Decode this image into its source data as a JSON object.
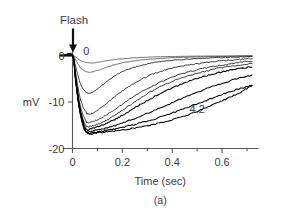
{
  "figure": {
    "panel_label": "(a)",
    "flash_marker_label": "Flash"
  },
  "chart_data": {
    "type": "line",
    "title": "",
    "subtitle": "",
    "xlabel": "Time (sec)",
    "ylabel": "mV",
    "xlim": [
      -0.035,
      0.72
    ],
    "ylim": [
      -20,
      1.5
    ],
    "grid": false,
    "legend_position": "inline-annotations",
    "x_ticks": [
      0,
      0.2,
      0.4,
      0.6
    ],
    "x_tick_labels": [
      "0",
      "0.2",
      "0.4",
      "0.6"
    ],
    "x_minor_ticks": [
      0.1,
      0.3,
      0.5,
      0.7
    ],
    "y_ticks": [
      0,
      -10,
      -20
    ],
    "y_tick_labels": [
      "0",
      "-10",
      "-20"
    ],
    "annotations": [
      {
        "text": "Flash",
        "x": 0.0,
        "y": 1.5,
        "note": "arrow marks flash onset at t = 0"
      },
      {
        "text": "0",
        "x": 0.055,
        "y": 0.2,
        "note": "label for dimmest flash trace"
      },
      {
        "text": "4.2",
        "x": 0.5,
        "y": -12.4,
        "note": "label for brightest flash trace, log intensity 4.2"
      }
    ],
    "series": [
      {
        "name": "0",
        "intensity_log": 0,
        "peak_mv": -1.6,
        "peak_time_sec": 0.075,
        "x": [
          -0.035,
          0,
          0.01,
          0.02,
          0.03,
          0.045,
          0.06,
          0.075,
          0.09,
          0.11,
          0.13,
          0.16,
          0.2,
          0.25,
          0.3,
          0.36,
          0.42,
          0.48,
          0.54,
          0.6,
          0.66,
          0.72
        ],
        "values": [
          0,
          0,
          -0.25,
          -0.6,
          -1.0,
          -1.35,
          -1.55,
          -1.6,
          -1.55,
          -1.4,
          -1.2,
          -0.95,
          -0.7,
          -0.5,
          -0.35,
          -0.25,
          -0.2,
          -0.15,
          -0.12,
          -0.1,
          -0.08,
          -0.05
        ]
      },
      {
        "name": "trace-2",
        "intensity_log": 0.6,
        "peak_mv": -3.6,
        "peak_time_sec": 0.07,
        "x": [
          -0.035,
          0,
          0.01,
          0.02,
          0.03,
          0.045,
          0.06,
          0.07,
          0.085,
          0.1,
          0.12,
          0.15,
          0.19,
          0.24,
          0.3,
          0.36,
          0.42,
          0.48,
          0.54,
          0.6,
          0.66,
          0.72
        ],
        "values": [
          0,
          0,
          -0.7,
          -1.6,
          -2.5,
          -3.2,
          -3.55,
          -3.6,
          -3.45,
          -3.2,
          -2.85,
          -2.3,
          -1.7,
          -1.2,
          -0.85,
          -0.6,
          -0.45,
          -0.35,
          -0.28,
          -0.22,
          -0.16,
          -0.1
        ]
      },
      {
        "name": "trace-3",
        "intensity_log": 1.2,
        "peak_mv": -8.1,
        "peak_time_sec": 0.065,
        "x": [
          -0.035,
          0,
          0.01,
          0.02,
          0.03,
          0.04,
          0.055,
          0.065,
          0.08,
          0.095,
          0.115,
          0.14,
          0.175,
          0.22,
          0.27,
          0.33,
          0.39,
          0.46,
          0.53,
          0.6,
          0.66,
          0.72
        ],
        "values": [
          0,
          0,
          -1.8,
          -3.9,
          -5.8,
          -7.0,
          -7.9,
          -8.1,
          -7.9,
          -7.4,
          -6.6,
          -5.5,
          -4.2,
          -3.0,
          -2.2,
          -1.5,
          -1.1,
          -0.8,
          -0.6,
          -0.45,
          -0.32,
          -0.2
        ]
      },
      {
        "name": "trace-4",
        "intensity_log": 1.8,
        "peak_mv": -12.6,
        "peak_time_sec": 0.062,
        "x": [
          -0.035,
          0,
          0.01,
          0.02,
          0.03,
          0.042,
          0.055,
          0.062,
          0.08,
          0.1,
          0.125,
          0.155,
          0.195,
          0.24,
          0.3,
          0.36,
          0.43,
          0.5,
          0.57,
          0.63,
          0.68,
          0.72
        ],
        "values": [
          0,
          0,
          -2.8,
          -6.2,
          -9.0,
          -11.0,
          -12.3,
          -12.6,
          -12.4,
          -11.8,
          -10.8,
          -9.5,
          -7.8,
          -6.2,
          -4.5,
          -3.3,
          -2.4,
          -1.8,
          -1.3,
          -1.0,
          -0.8,
          -0.6
        ]
      },
      {
        "name": "trace-5",
        "intensity_log": 2.2,
        "peak_mv": -14.4,
        "peak_time_sec": 0.06,
        "x": [
          -0.035,
          0,
          0.01,
          0.02,
          0.03,
          0.042,
          0.055,
          0.06,
          0.085,
          0.11,
          0.14,
          0.18,
          0.23,
          0.29,
          0.35,
          0.42,
          0.49,
          0.56,
          0.62,
          0.67,
          0.72
        ],
        "values": [
          0,
          0,
          -3.4,
          -7.4,
          -10.6,
          -12.8,
          -14.2,
          -14.4,
          -14.2,
          -13.6,
          -12.7,
          -11.2,
          -9.4,
          -7.4,
          -5.8,
          -4.3,
          -3.2,
          -2.4,
          -1.9,
          -1.5,
          -1.2
        ]
      },
      {
        "name": "trace-6",
        "intensity_log": 2.6,
        "peak_mv": -15.3,
        "peak_time_sec": 0.058,
        "x": [
          -0.035,
          0,
          0.01,
          0.02,
          0.032,
          0.045,
          0.058,
          0.075,
          0.1,
          0.13,
          0.165,
          0.21,
          0.26,
          0.32,
          0.39,
          0.46,
          0.53,
          0.6,
          0.66,
          0.72
        ],
        "values": [
          0,
          0,
          -3.9,
          -8.4,
          -12.0,
          -14.1,
          -15.3,
          -15.2,
          -14.8,
          -14.1,
          -13.0,
          -11.4,
          -9.6,
          -7.6,
          -5.8,
          -4.4,
          -3.4,
          -2.6,
          -2.1,
          -1.7
        ]
      },
      {
        "name": "trace-7",
        "intensity_log": 3.0,
        "peak_mv": -15.9,
        "peak_time_sec": 0.055,
        "x": [
          -0.035,
          0,
          0.012,
          0.025,
          0.038,
          0.055,
          0.075,
          0.1,
          0.135,
          0.175,
          0.22,
          0.27,
          0.33,
          0.4,
          0.47,
          0.54,
          0.6,
          0.66,
          0.72
        ],
        "values": [
          0,
          0,
          -4.6,
          -9.6,
          -13.2,
          -15.9,
          -15.7,
          -15.3,
          -14.6,
          -13.6,
          -12.2,
          -10.6,
          -8.8,
          -7.0,
          -5.5,
          -4.3,
          -3.5,
          -2.9,
          -2.4
        ]
      },
      {
        "name": "trace-8",
        "intensity_log": 3.4,
        "peak_mv": -16.4,
        "peak_time_sec": 0.055,
        "x": [
          -0.035,
          0,
          0.012,
          0.025,
          0.04,
          0.055,
          0.08,
          0.11,
          0.15,
          0.2,
          0.26,
          0.32,
          0.39,
          0.46,
          0.53,
          0.6,
          0.66,
          0.72
        ],
        "values": [
          0,
          0,
          -5.0,
          -10.4,
          -14.2,
          -16.4,
          -16.2,
          -15.9,
          -15.4,
          -14.5,
          -13.3,
          -12.0,
          -10.4,
          -8.8,
          -7.3,
          -6.0,
          -5.0,
          -4.2
        ]
      },
      {
        "name": "trace-9",
        "intensity_log": 3.8,
        "peak_mv": -16.7,
        "peak_time_sec": 0.06,
        "x": [
          -0.035,
          0,
          0.012,
          0.026,
          0.042,
          0.06,
          0.09,
          0.125,
          0.17,
          0.22,
          0.28,
          0.35,
          0.42,
          0.49,
          0.56,
          0.62,
          0.68,
          0.72
        ],
        "values": [
          0,
          0,
          -5.2,
          -11.0,
          -15.0,
          -16.7,
          -16.5,
          -16.2,
          -15.8,
          -15.2,
          -14.4,
          -13.3,
          -12.0,
          -10.6,
          -9.2,
          -8.0,
          -7.0,
          -6.4
        ]
      },
      {
        "name": "4.2",
        "intensity_log": 4.2,
        "peak_mv": -16.8,
        "peak_time_sec": 0.065,
        "x": [
          -0.035,
          0,
          0.013,
          0.028,
          0.045,
          0.065,
          0.1,
          0.14,
          0.19,
          0.25,
          0.31,
          0.38,
          0.45,
          0.52,
          0.58,
          0.64,
          0.69,
          0.72
        ],
        "values": [
          0,
          0,
          -5.4,
          -11.4,
          -15.4,
          -16.8,
          -16.6,
          -16.4,
          -16.1,
          -15.6,
          -15.0,
          -14.1,
          -13.0,
          -11.6,
          -10.2,
          -8.8,
          -7.4,
          -6.5
        ]
      }
    ]
  }
}
